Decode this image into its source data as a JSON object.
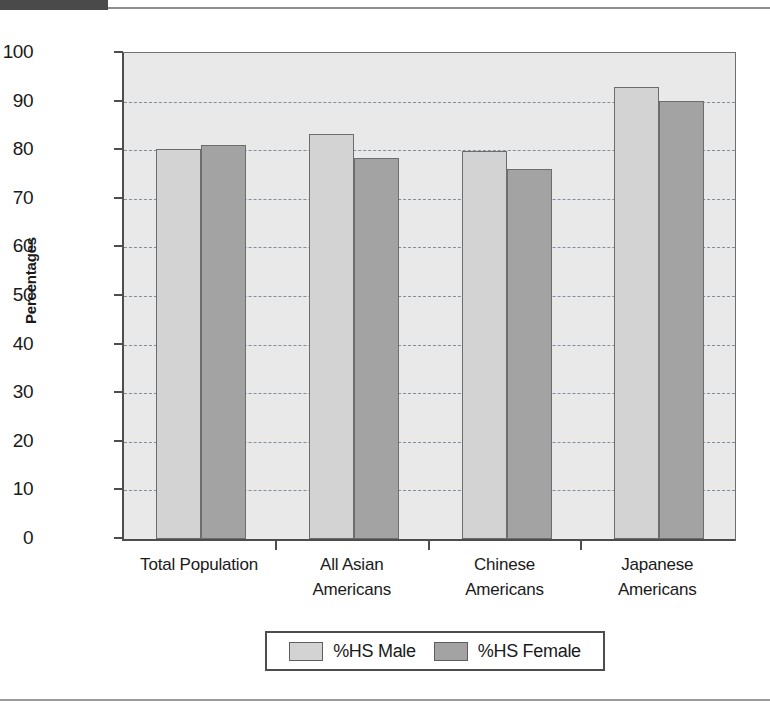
{
  "document": {
    "header_strip_color": "#4a4a4a",
    "separator_color": "#9a9a9a"
  },
  "chart_data": {
    "type": "bar",
    "title": "",
    "xlabel": "",
    "ylabel": "Percentages",
    "ylim": [
      0,
      100
    ],
    "ytick_step": 10,
    "yticks": [
      "100",
      "90",
      "80",
      "70",
      "60",
      "50",
      "40",
      "30",
      "20",
      "10",
      "0"
    ],
    "grid": true,
    "grid_style": "dashed horizontal",
    "legend_position": "bottom-center",
    "categories": [
      {
        "line1": "Total Population",
        "line2": ""
      },
      {
        "line1": "All Asian",
        "line2": "Americans"
      },
      {
        "line1": "Chinese",
        "line2": "Americans"
      },
      {
        "line1": "Japanese",
        "line2": "Americans"
      }
    ],
    "series": [
      {
        "name": "%HS Male",
        "color": "#d3d3d3",
        "values": [
          80.3,
          83.3,
          79.8,
          93.0
        ]
      },
      {
        "name": "%HS Female",
        "color": "#a3a3a3",
        "values": [
          81.1,
          78.5,
          76.1,
          90.1
        ]
      }
    ]
  },
  "legend": {
    "items": [
      {
        "label": "%HS Male",
        "color": "#d3d3d3"
      },
      {
        "label": "%HS Female",
        "color": "#a3a3a3"
      }
    ]
  },
  "colors": {
    "plot_background": "#e9e9e9",
    "axis": "#4d4d4d",
    "gridline": "#7d8fa3",
    "bar_male": "#d3d3d3",
    "bar_female": "#a3a3a3"
  }
}
